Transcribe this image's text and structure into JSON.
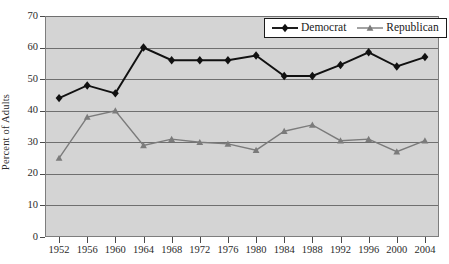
{
  "chart_data": {
    "type": "line",
    "title": "",
    "xlabel": "",
    "ylabel": "Percent of Adults",
    "categories": [
      "1952",
      "1956",
      "1960",
      "1964",
      "1968",
      "1972",
      "1976",
      "1980",
      "1984",
      "1988",
      "1992",
      "1996",
      "2000",
      "2004"
    ],
    "series": [
      {
        "name": "Democrat",
        "marker": "diamond",
        "color": "#111111",
        "values": [
          44,
          48,
          45.5,
          60,
          56,
          56,
          56,
          57.5,
          51,
          51,
          54.5,
          58.5,
          54,
          57
        ]
      },
      {
        "name": "Republican",
        "marker": "triangle",
        "color": "#7b7b7b",
        "values": [
          25,
          38,
          40,
          29,
          31,
          30,
          29.5,
          27.5,
          33.5,
          35.5,
          30.5,
          31,
          27,
          30.5
        ]
      }
    ],
    "ylim": [
      0,
      70
    ],
    "ytick_values": [
      0,
      10,
      20,
      30,
      40,
      50,
      60,
      70
    ],
    "ytick_labels": [
      "0",
      "10",
      "20",
      "30",
      "40",
      "50",
      "60",
      "70"
    ],
    "grid": "horizontal",
    "legend_position": "top-right",
    "plot_background": "#d4d4d4",
    "grid_color": "#6f6f6f",
    "frame_color": "#7d7d7d"
  },
  "legend": {
    "entries": [
      {
        "label": "Democrat"
      },
      {
        "label": "Republican"
      }
    ]
  },
  "icons": {
    "diamond_marker": "diamond-marker-icon",
    "triangle_marker": "triangle-marker-icon"
  }
}
